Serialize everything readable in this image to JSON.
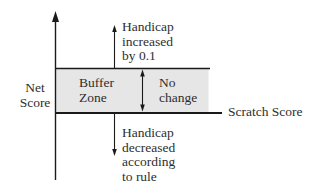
{
  "diagram": {
    "y_axis_label": [
      "Net",
      "Score"
    ],
    "x_axis_label": "Scratch Score",
    "buffer_zone_label": [
      "Buffer",
      "Zone"
    ],
    "no_change_label": [
      "No",
      "change"
    ],
    "above_label": [
      "Handicap",
      "increased",
      "by 0.1"
    ],
    "below_label": [
      "Handicap",
      "decreased",
      "according",
      "to rule"
    ],
    "colors": {
      "buffer_fill": "#e6e6e6",
      "line": "#1a1a1a",
      "text": "#2e2e2e"
    }
  }
}
